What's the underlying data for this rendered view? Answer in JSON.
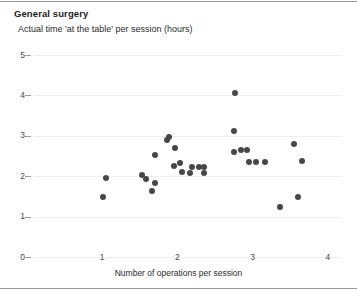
{
  "chart_data": {
    "type": "scatter",
    "title": "General surgery",
    "subtitle": "Actual time 'at the table' per session (hours)",
    "xlabel": "Number of operations per session",
    "ylabel": "",
    "xlim": [
      0.6,
      4.0
    ],
    "ylim": [
      0,
      5
    ],
    "xticks": [
      1,
      2,
      3,
      4
    ],
    "yticks": [
      0,
      1,
      2,
      3,
      4,
      5
    ],
    "grid": true,
    "legend": "none",
    "marker_color": "#474747",
    "points": [
      {
        "x": 1.05,
        "y": 1.95
      },
      {
        "x": 1.01,
        "y": 1.48
      },
      {
        "x": 1.53,
        "y": 2.03
      },
      {
        "x": 1.59,
        "y": 1.93
      },
      {
        "x": 1.66,
        "y": 1.63
      },
      {
        "x": 1.71,
        "y": 1.84
      },
      {
        "x": 1.89,
        "y": 2.98
      },
      {
        "x": 1.86,
        "y": 2.89
      },
      {
        "x": 1.97,
        "y": 2.7
      },
      {
        "x": 1.71,
        "y": 2.53
      },
      {
        "x": 2.03,
        "y": 2.33
      },
      {
        "x": 1.95,
        "y": 2.25
      },
      {
        "x": 2.06,
        "y": 2.1
      },
      {
        "x": 2.36,
        "y": 2.22
      },
      {
        "x": 2.19,
        "y": 2.22
      },
      {
        "x": 2.29,
        "y": 2.24
      },
      {
        "x": 2.17,
        "y": 2.08
      },
      {
        "x": 2.36,
        "y": 2.07
      },
      {
        "x": 2.75,
        "y": 3.12
      },
      {
        "x": 2.76,
        "y": 4.05
      },
      {
        "x": 2.75,
        "y": 2.6
      },
      {
        "x": 2.93,
        "y": 2.65
      },
      {
        "x": 2.84,
        "y": 2.65
      },
      {
        "x": 2.95,
        "y": 2.35
      },
      {
        "x": 3.05,
        "y": 2.35
      },
      {
        "x": 3.16,
        "y": 2.35
      },
      {
        "x": 3.55,
        "y": 2.8
      },
      {
        "x": 3.66,
        "y": 2.38
      },
      {
        "x": 3.6,
        "y": 1.48
      },
      {
        "x": 3.37,
        "y": 1.24
      }
    ]
  }
}
